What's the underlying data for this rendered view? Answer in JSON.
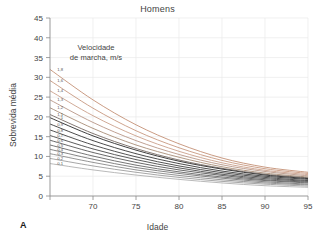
{
  "chart_data": {
    "type": "line",
    "title": "Homens",
    "panel_letter": "A",
    "xlabel": "Idade",
    "ylabel": "Sobrevida média",
    "xlim": [
      65,
      95
    ],
    "ylim": [
      0,
      45
    ],
    "xticks": [
      65,
      70,
      75,
      80,
      85,
      90,
      95
    ],
    "xticklabels": [
      "",
      "70",
      "75",
      "80",
      "85",
      "90",
      "95"
    ],
    "yticks": [
      0,
      5,
      10,
      15,
      20,
      25,
      30,
      35,
      40,
      45
    ],
    "yticklabels": [
      "0",
      "5",
      "10",
      "15",
      "20",
      "25",
      "30",
      "35",
      "40",
      "45"
    ],
    "grid": true,
    "legend_position": "inside-upper-left",
    "legend_title": "Velocidade\nde marcha, m/s",
    "legend_title_line1": "Velocidade",
    "legend_title_line2": "de marcha, m/s",
    "x": [
      65,
      70,
      75,
      80,
      85,
      90,
      95
    ],
    "series": [
      {
        "name": "1,8",
        "label": "1,8",
        "color": "#c08a6e",
        "values": [
          32.0,
          24.3,
          18.0,
          13.2,
          9.6,
          7.3,
          6.0
        ]
      },
      {
        "name": "1,6",
        "label": "1,6",
        "color": "#c49279",
        "values": [
          29.2,
          22.2,
          16.5,
          12.2,
          9.0,
          6.9,
          5.7
        ]
      },
      {
        "name": "1,4",
        "label": "1,4",
        "color": "#c79b84",
        "values": [
          26.6,
          20.3,
          15.2,
          11.3,
          8.4,
          6.5,
          5.4
        ]
      },
      {
        "name": "1,3",
        "label": "1,3",
        "color": "#b4907f",
        "values": [
          24.3,
          18.6,
          14.0,
          10.5,
          7.9,
          6.2,
          5.1
        ]
      },
      {
        "name": "1,2",
        "label": "1,2",
        "color": "#a3866f",
        "values": [
          22.3,
          17.1,
          12.9,
          9.8,
          7.4,
          5.8,
          4.8
        ]
      },
      {
        "name": "1,1",
        "label": "1,1",
        "color": "#6d6058",
        "values": [
          20.6,
          15.8,
          12.0,
          9.1,
          7.0,
          5.5,
          4.6
        ]
      },
      {
        "name": "1",
        "label": "1",
        "color": "#1e1e1e",
        "values": [
          19.8,
          15.2,
          11.6,
          8.8,
          6.8,
          5.3,
          4.4
        ]
      },
      {
        "name": "0,9",
        "label": "0,9",
        "color": "#2a2a2a",
        "values": [
          18.2,
          14.0,
          10.7,
          8.2,
          6.3,
          5.0,
          4.2
        ]
      },
      {
        "name": "0,8",
        "label": "0,8",
        "color": "#343434",
        "values": [
          16.7,
          12.9,
          9.9,
          7.6,
          5.9,
          4.7,
          3.9
        ]
      },
      {
        "name": "0,7",
        "label": "0,7",
        "color": "#3f3f3f",
        "values": [
          15.3,
          11.9,
          9.2,
          7.1,
          5.5,
          4.4,
          3.7
        ]
      },
      {
        "name": "0,6",
        "label": "0,6",
        "color": "#4d4d4d",
        "values": [
          14.1,
          11.0,
          8.5,
          6.6,
          5.2,
          4.1,
          3.5
        ]
      },
      {
        "name": "0,5",
        "label": "0,5",
        "color": "#5c5c5c",
        "values": [
          12.9,
          10.1,
          7.8,
          6.1,
          4.8,
          3.9,
          3.3
        ]
      },
      {
        "name": "0,4",
        "label": "0,4",
        "color": "#6e6e6e",
        "values": [
          11.8,
          9.3,
          7.2,
          5.7,
          4.5,
          3.6,
          3.0
        ]
      },
      {
        "name": "0,3",
        "label": "0,3",
        "color": "#828282",
        "values": [
          10.7,
          8.5,
          6.6,
          5.2,
          4.1,
          3.3,
          2.8
        ]
      },
      {
        "name": "0,2",
        "label": "0,2",
        "color": "#979797",
        "values": [
          9.5,
          7.6,
          6.0,
          4.7,
          3.7,
          3.0,
          2.5
        ]
      },
      {
        "name": "0,1",
        "label": "0,1",
        "color": "#acacac",
        "values": [
          8.2,
          6.6,
          5.3,
          4.2,
          3.3,
          2.6,
          2.2
        ]
      }
    ]
  }
}
